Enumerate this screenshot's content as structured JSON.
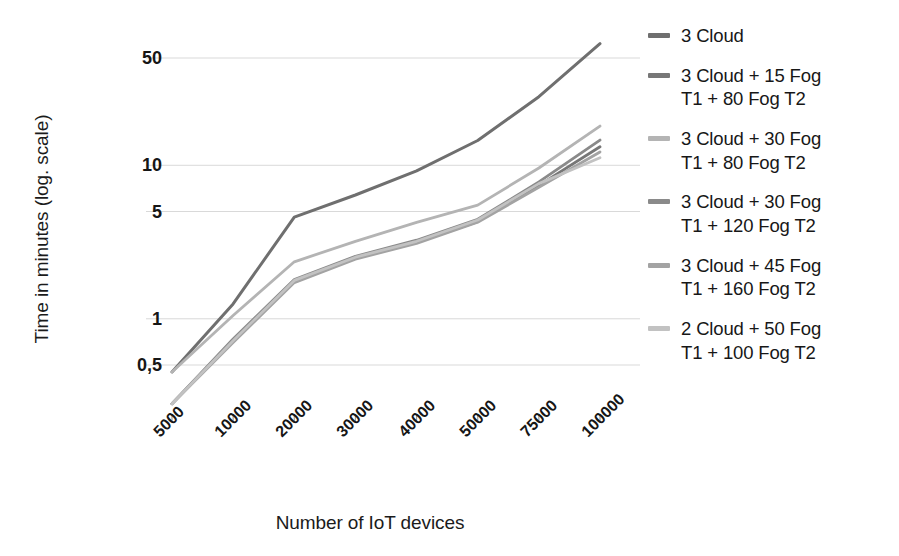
{
  "chart_data": {
    "type": "line",
    "title": "",
    "xlabel": "Number of IoT devices",
    "ylabel": "Time in minutes (log. scale)",
    "yscale": "log",
    "grid": true,
    "legend_position": "right",
    "categories": [
      "5000",
      "10000",
      "20000",
      "30000",
      "40000",
      "50000",
      "75000",
      "100000"
    ],
    "y_ticks": [
      "0,5",
      "1",
      "5",
      "10",
      "50"
    ],
    "y_tick_values": [
      0.5,
      1,
      5,
      10,
      50
    ],
    "ylim": [
      0.22,
      75
    ],
    "series": [
      {
        "name": "3 Cloud",
        "label": "3 Cloud",
        "color": "#6f6f6f",
        "values": [
          0.45,
          1.25,
          4.6,
          6.4,
          9.2,
          14.5,
          28.0,
          62.0
        ]
      },
      {
        "name": "3 Cloud  + 15 Fog T1 + 80 Fog T2",
        "label": "3 Cloud  + 15 Fog\nT1 + 80 Fog T2",
        "color": "#777777",
        "values": [
          0.28,
          0.72,
          1.75,
          2.5,
          3.15,
          4.3,
          7.4,
          13.2
        ]
      },
      {
        "name": "3 Cloud + 30 Fog T1 + 80 Fog T2",
        "label": "3 Cloud + 30 Fog\nT1 + 80 Fog T2",
        "color": "#b4b4b4",
        "values": [
          0.45,
          1.05,
          2.35,
          3.2,
          4.25,
          5.5,
          9.6,
          18.0
        ]
      },
      {
        "name": "3 Cloud + 30 Fog T1 + 120 Fog T2",
        "label": "3 Cloud + 30 Fog\nT1 + 120 Fog T2",
        "color": "#8a8a8a",
        "values": [
          0.28,
          0.74,
          1.8,
          2.55,
          3.25,
          4.45,
          7.8,
          14.6
        ]
      },
      {
        "name": "3 Cloud + 45 Fog T1 + 160 Fog T2",
        "label": "3 Cloud + 45 Fog\nT1 + 160 Fog T2",
        "color": "#a3a3a3",
        "values": [
          0.28,
          0.7,
          1.72,
          2.45,
          3.1,
          4.25,
          7.2,
          12.2
        ]
      },
      {
        "name": "2 Cloud + 50 Fog T1 + 100 Fog T2",
        "label": "2 Cloud + 50 Fog\nT1 + 100 Fog T2",
        "color": "#c2c2c2",
        "values": [
          0.28,
          0.72,
          1.78,
          2.52,
          3.2,
          4.4,
          7.6,
          11.2
        ]
      }
    ]
  },
  "legend": {
    "items": [
      {
        "label": "3 Cloud",
        "color": "#6f6f6f"
      },
      {
        "label": "3 Cloud  + 15 Fog\nT1 + 80 Fog T2",
        "color": "#777777"
      },
      {
        "label": "3 Cloud + 30 Fog\nT1 + 80 Fog T2",
        "color": "#b4b4b4"
      },
      {
        "label": "3 Cloud + 30 Fog\nT1 + 120 Fog T2",
        "color": "#8a8a8a"
      },
      {
        "label": "3 Cloud + 45 Fog\nT1 + 160 Fog T2",
        "color": "#a3a3a3"
      },
      {
        "label": "2 Cloud + 50 Fog\nT1 + 100 Fog T2",
        "color": "#c2c2c2"
      }
    ]
  },
  "axes": {
    "y_title": "Time in minutes (log. scale)",
    "x_title": "Number of IoT devices"
  },
  "style": {
    "grid_color": "#d9d9d9",
    "background": "#ffffff",
    "text_color": "#1a1a1a"
  }
}
